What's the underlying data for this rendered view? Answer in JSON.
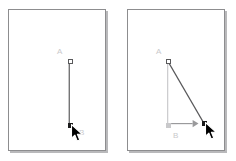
{
  "figure": {
    "background_color": "#ffffff",
    "panel_border_color": "#8d8d8f",
    "panel_shadow_color": "#b9b9bb",
    "line_color_active": "#59595b",
    "line_color_ghost": "#c9c9cb",
    "handle_fill_selected": "#1b1b1b",
    "handle_fill_open": "#ffffff",
    "label_color": "#c9c9cb",
    "arrow_color": "#9a9a9c",
    "cursor_fill": "#000000",
    "cursor_outline": "#ffffff"
  },
  "panels": [
    {
      "id": "before",
      "name": "before-drag",
      "points": [
        {
          "id": "A",
          "label": "A",
          "label_x": 48,
          "label_y": 38,
          "x": 59,
          "y": 49,
          "marker": "hollow"
        },
        {
          "id": "B",
          "label": "B",
          "label_x": 70,
          "label_y": 119,
          "x": 59,
          "y": 113,
          "marker": "solid"
        }
      ],
      "segments": [
        {
          "from": "A",
          "to": "B",
          "style": "solid",
          "color": "#59595b",
          "x1": 61.5,
          "y1": 51.5,
          "x2": 61.5,
          "y2": 115.5
        }
      ],
      "cursor": {
        "x": 62,
        "y": 114
      },
      "drag_arrow": null
    },
    {
      "id": "after",
      "name": "after-drag",
      "points": [
        {
          "id": "A",
          "label": "A",
          "label_x": 28,
          "label_y": 38,
          "x": 38,
          "y": 49,
          "marker": "hollow"
        },
        {
          "id": "Bghost",
          "label": "B",
          "label_x": 45,
          "label_y": 122,
          "x": 38,
          "y": 113,
          "marker": "ghost"
        },
        {
          "id": "Bnew",
          "label": "",
          "label_x": 0,
          "label_y": 0,
          "x": 74,
          "y": 111,
          "marker": "solid"
        }
      ],
      "segments": [
        {
          "from": "A",
          "to": "Bghost",
          "style": "ghost",
          "color": "#c9c9cb",
          "x1": 40.5,
          "y1": 51.5,
          "x2": 40.5,
          "y2": 115.5
        },
        {
          "from": "A",
          "to": "Bnew",
          "style": "solid",
          "color": "#59595b",
          "x1": 40.5,
          "y1": 51.5,
          "x2": 76.5,
          "y2": 113.5
        }
      ],
      "cursor": {
        "x": 77,
        "y": 112
      },
      "drag_arrow": {
        "x1": 44,
        "y1": 115.5,
        "x2": 72,
        "y2": 115.5,
        "color": "#9a9a9c"
      }
    }
  ]
}
